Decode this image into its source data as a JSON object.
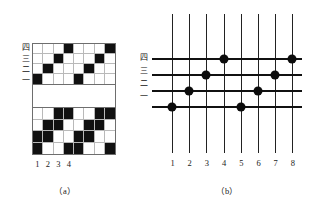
{
  "figure": {
    "captions": {
      "a": "（a）",
      "b": "（b）"
    },
    "colors": {
      "fill": "#111111",
      "grid_line": "#b9b9b9",
      "border": "#6e6e6e",
      "dot": "#0c0c0c",
      "line": "#111111"
    }
  },
  "panel_a": {
    "shaft_labels": [
      {
        "label": "四"
      },
      {
        "label": "三"
      },
      {
        "label": "二"
      },
      {
        "label": "一"
      }
    ],
    "column_numbers": [
      "1",
      "2",
      "3",
      "4"
    ],
    "top_grid": {
      "rows": 4,
      "cols": 8,
      "description": "point-draft threading plan, one mark per column",
      "cells": [
        [
          0,
          0,
          0,
          1,
          0,
          0,
          0,
          1
        ],
        [
          0,
          0,
          1,
          0,
          0,
          0,
          1,
          0
        ],
        [
          0,
          1,
          0,
          0,
          0,
          1,
          0,
          0
        ],
        [
          1,
          0,
          0,
          0,
          1,
          0,
          0,
          0
        ]
      ]
    },
    "bottom_grid": {
      "rows": 4,
      "cols": 8,
      "description": "drawdown / weave interlacing pattern",
      "cells": [
        [
          0,
          0,
          1,
          1,
          0,
          0,
          1,
          1
        ],
        [
          0,
          1,
          1,
          0,
          0,
          1,
          1,
          0
        ],
        [
          1,
          1,
          0,
          0,
          1,
          1,
          0,
          0
        ],
        [
          1,
          0,
          0,
          1,
          1,
          0,
          0,
          1
        ]
      ]
    }
  },
  "panel_b": {
    "shaft_labels": [
      {
        "label": "四"
      },
      {
        "label": "三"
      },
      {
        "label": "二"
      },
      {
        "label": "一"
      }
    ],
    "column_numbers": [
      "1",
      "2",
      "3",
      "4",
      "5",
      "6",
      "7",
      "8"
    ],
    "vertical_lines": 8,
    "horizontal_lines": 4,
    "dots": [
      {
        "shaft": "四",
        "row": 0,
        "column": 4
      },
      {
        "shaft": "四",
        "row": 0,
        "column": 8
      },
      {
        "shaft": "三",
        "row": 1,
        "column": 3
      },
      {
        "shaft": "三",
        "row": 1,
        "column": 7
      },
      {
        "shaft": "二",
        "row": 2,
        "column": 2
      },
      {
        "shaft": "二",
        "row": 2,
        "column": 6
      },
      {
        "shaft": "一",
        "row": 3,
        "column": 1
      },
      {
        "shaft": "一",
        "row": 3,
        "column": 5
      }
    ]
  }
}
